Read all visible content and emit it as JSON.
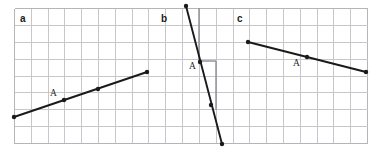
{
  "figure": {
    "width": 378,
    "height": 151,
    "background_color": "#ffffff"
  },
  "grid": {
    "x": 14,
    "y": 8,
    "width": 353,
    "height": 135,
    "cell_size": 16.8,
    "columns": 21,
    "rows": 8,
    "line_color": "#c6c6cb",
    "border_color": "#b4b4ba",
    "guide_color": "#8d8d93"
  },
  "colors": {
    "line": "#1a1a1a",
    "point": "#1a1a1a",
    "label": "#1a1a1a",
    "grid": "#c6c6cb"
  },
  "panels": [
    {
      "id": "a",
      "label": "a",
      "label_x": 20,
      "label_y": 22,
      "point_label": "A",
      "point_label_x": 50,
      "point_label_y": 96,
      "segment": {
        "x1": 14,
        "y1": 117,
        "x2": 147,
        "y2": 72
      },
      "points": [
        {
          "x": 14,
          "y": 117
        },
        {
          "x": 64,
          "y": 100
        },
        {
          "x": 98,
          "y": 89
        },
        {
          "x": 147,
          "y": 72
        }
      ],
      "slope_guides": []
    },
    {
      "id": "b",
      "label": "b",
      "label_x": 161,
      "label_y": 22,
      "point_label": "A",
      "point_label_x": 189,
      "point_label_y": 69,
      "segment": {
        "x1": 186,
        "y1": 6,
        "x2": 222,
        "y2": 144
      },
      "points": [
        {
          "x": 186,
          "y": 6
        },
        {
          "x": 200,
          "y": 62
        },
        {
          "x": 211,
          "y": 105
        },
        {
          "x": 222,
          "y": 144
        }
      ],
      "slope_guides": [
        {
          "x1": 199,
          "y1": 8,
          "x2": 199,
          "y2": 61
        },
        {
          "x1": 199,
          "y1": 61,
          "x2": 216,
          "y2": 61
        },
        {
          "x1": 216,
          "y1": 61,
          "x2": 216,
          "y2": 110
        },
        {
          "x1": 216,
          "y1": 110,
          "x2": 216,
          "y2": 110
        }
      ]
    },
    {
      "id": "c",
      "label": "c",
      "label_x": 237,
      "label_y": 22,
      "point_label": "A",
      "point_label_x": 293,
      "point_label_y": 66,
      "segment": {
        "x1": 248,
        "y1": 42,
        "x2": 366,
        "y2": 72
      },
      "points": [
        {
          "x": 248,
          "y": 42
        },
        {
          "x": 307,
          "y": 57
        },
        {
          "x": 366,
          "y": 72
        }
      ],
      "slope_guides": []
    }
  ],
  "chart_data": {
    "type": "line",
    "xlabel": "",
    "ylabel": "",
    "grid": true,
    "legend": "none",
    "series": [
      {
        "name": "a",
        "x": [
          0,
          3,
          5,
          8
        ],
        "y": [
          0,
          1,
          1.65,
          2.7
        ],
        "slope": 0.333,
        "marked_point": "A"
      },
      {
        "name": "b",
        "x": [
          0,
          0.8,
          1.5,
          2.15
        ],
        "y": [
          8,
          4.7,
          2.1,
          -0.2
        ],
        "slope": -3.8,
        "marked_point": "A"
      },
      {
        "name": "c",
        "x": [
          0,
          3.5,
          7
        ],
        "y": [
          6,
          5.1,
          4.2
        ],
        "slope": -0.25,
        "marked_point": "A"
      }
    ]
  }
}
